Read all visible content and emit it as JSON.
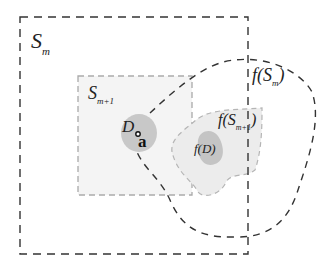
{
  "diagram": {
    "type": "set-mapping-illustration",
    "colors": {
      "outer_dash": "#333333",
      "inner_dash": "#aaaaaa",
      "inner_fill": "#f4f4f4",
      "blob_fill": "#c8c8c8",
      "image_blob_fill": "#e2e2e2"
    },
    "labels": {
      "s_m": {
        "base": "S",
        "sub": "m"
      },
      "s_m1": {
        "base": "S",
        "sub": "m+1"
      },
      "d": "D",
      "point_a": "a",
      "f_s_m": {
        "pre": "f(S",
        "sub": "m",
        "post": ")"
      },
      "f_s_m1": {
        "pre": "f(S",
        "sub": "m+1",
        "post": ")"
      },
      "f_d": "f(D)"
    }
  }
}
